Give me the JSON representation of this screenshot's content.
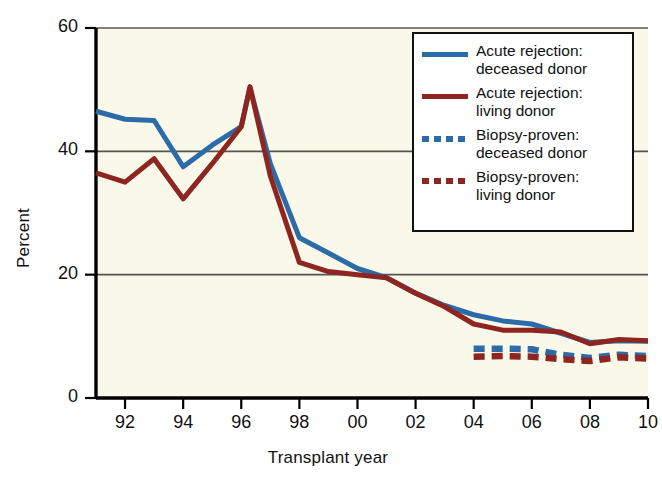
{
  "chart_data": {
    "type": "line",
    "title": "",
    "xlabel": "Transplant year",
    "ylabel": "Percent",
    "xlim": [
      1991,
      2010
    ],
    "ylim": [
      0,
      60
    ],
    "yticks": [
      0,
      20,
      40,
      60
    ],
    "ytick_labels": [
      "0",
      "20",
      "40",
      "60"
    ],
    "xticks": [
      1992,
      1994,
      1996,
      1998,
      2000,
      2002,
      2004,
      2006,
      2008,
      2010
    ],
    "xtick_labels": [
      "92",
      "94",
      "96",
      "98",
      "00",
      "02",
      "04",
      "06",
      "08",
      "10"
    ],
    "grid": "horizontal",
    "legend_position": "top-right",
    "background": "#faf8e8",
    "series": [
      {
        "name": "Acute rejection: deceased donor",
        "color": "#2b6ca8",
        "style": "solid",
        "x": [
          1991,
          1992,
          1993,
          1994,
          1995,
          1996,
          1996.3,
          1997,
          1998,
          1999,
          2000,
          2001,
          2002,
          2003,
          2004,
          2005,
          2006,
          2007,
          2008,
          2009,
          2010
        ],
        "values": [
          46.5,
          45.2,
          45.0,
          37.5,
          41.0,
          44.0,
          50.3,
          38.0,
          26.0,
          23.5,
          21.0,
          19.5,
          17.0,
          15.0,
          13.5,
          12.5,
          12.0,
          10.5,
          9.0,
          9.3,
          9.2
        ]
      },
      {
        "name": "Acute rejection: living donor",
        "color": "#8f2521",
        "style": "solid",
        "x": [
          1991,
          1992,
          1993,
          1994,
          1995,
          1996,
          1996.3,
          1997,
          1998,
          1999,
          2000,
          2001,
          2002,
          2003,
          2004,
          2005,
          2006,
          2007,
          2008,
          2009,
          2010
        ],
        "values": [
          36.5,
          35.0,
          38.8,
          32.3,
          38.0,
          44.0,
          50.5,
          36.0,
          22.0,
          20.5,
          20.0,
          19.5,
          17.0,
          14.8,
          12.0,
          11.0,
          11.0,
          10.7,
          8.8,
          9.5,
          9.3
        ]
      },
      {
        "name": "Biopsy-proven: deceased donor",
        "color": "#2b6ca8",
        "style": "dashed",
        "x": [
          2004,
          2005,
          2006,
          2007,
          2008,
          2009,
          2010
        ],
        "values": [
          8.0,
          8.0,
          7.9,
          7.0,
          6.5,
          7.0,
          6.8
        ]
      },
      {
        "name": "Biopsy-proven: living donor",
        "color": "#8f2521",
        "style": "dashed",
        "x": [
          2004,
          2005,
          2006,
          2007,
          2008,
          2009,
          2010
        ],
        "values": [
          6.7,
          6.8,
          6.7,
          6.3,
          6.0,
          6.6,
          6.4
        ]
      }
    ]
  },
  "axes": {
    "ylabel": "Percent",
    "xlabel": "Transplant year"
  },
  "legend": {
    "items": [
      {
        "line1": "Acute rejection:",
        "line2": "deceased donor",
        "color": "#2b6ca8",
        "style": "solid"
      },
      {
        "line1": "Acute rejection:",
        "line2": "living donor",
        "color": "#8f2521",
        "style": "solid"
      },
      {
        "line1": "Biopsy-proven:",
        "line2": "deceased donor",
        "color": "#2b6ca8",
        "style": "dashed"
      },
      {
        "line1": "Biopsy-proven:",
        "line2": "living donor",
        "color": "#8f2521",
        "style": "dashed"
      }
    ]
  }
}
